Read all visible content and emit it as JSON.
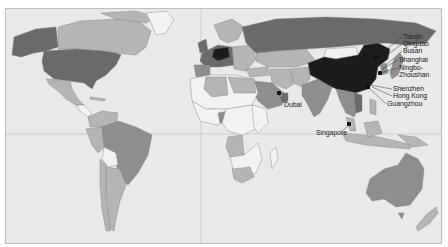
{
  "map": {
    "type": "world-choropleth",
    "palette": {
      "ocean": "#e9e9e9",
      "level_0": "#f2f2f2",
      "level_1": "#b5b5b5",
      "level_2": "#8e8e8e",
      "level_3": "#6a6a6a",
      "level_4": "#1c1c1c",
      "border": "#7a7a7a",
      "gridline": "#c4c4c4"
    },
    "ports": [
      {
        "name": "Tianjin",
        "label": "Tianjin"
      },
      {
        "name": "Qingdao",
        "label": "Qingdao"
      },
      {
        "name": "Busan",
        "label": "Busan"
      },
      {
        "name": "Shanghai",
        "label": "Shanghai"
      },
      {
        "name": "Ningbo-Zhoushan",
        "label_line1": "Ningbo-",
        "label_line2": "Zhoushan"
      },
      {
        "name": "Shenzhen",
        "label": "Shenzhen"
      },
      {
        "name": "Hong Kong",
        "label": "Hong Kong"
      },
      {
        "name": "Guangzhou",
        "label": "Guangzhou"
      },
      {
        "name": "Dubai",
        "label": "Dubai"
      },
      {
        "name": "Singapore",
        "label": "Singapore"
      }
    ]
  }
}
